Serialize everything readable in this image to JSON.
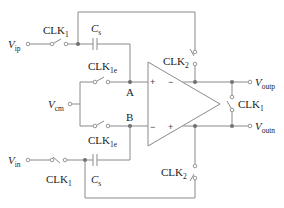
{
  "diagram": {
    "inputs": {
      "vip": {
        "main": "V",
        "sub": "ip"
      },
      "vin": {
        "main": "V",
        "sub": "in"
      },
      "vcm": {
        "main": "V",
        "sub": "cm"
      }
    },
    "outputs": {
      "voutp": {
        "main": "V",
        "sub": "outp"
      },
      "voutn": {
        "main": "V",
        "sub": "outn"
      }
    },
    "switches": {
      "clk1_top": {
        "main": "CLK",
        "sub": "1"
      },
      "clk1_bottom": {
        "main": "CLK",
        "sub": "1"
      },
      "clk1e_top": {
        "main": "CLK",
        "sub": "1e"
      },
      "clk1e_bottom": {
        "main": "CLK",
        "sub": "1e"
      },
      "clk2_top": {
        "main": "CLK",
        "sub": "2"
      },
      "clk2_bottom": {
        "main": "CLK",
        "sub": "2"
      },
      "clk1_out": {
        "main": "CLK",
        "sub": "1"
      }
    },
    "capacitors": {
      "cs_top": {
        "main": "C",
        "sub": "s"
      },
      "cs_bottom": {
        "main": "C",
        "sub": "s"
      }
    },
    "nodes": {
      "a": "A",
      "b": "B"
    },
    "opamp": {
      "in_top_plus": "+",
      "in_top_minus": "−",
      "in_bottom_minus": "−",
      "in_bottom_plus": "+"
    },
    "colors": {
      "wire": "#8a8a8a",
      "text": "#222222",
      "dot": "#6e6e6e"
    }
  }
}
